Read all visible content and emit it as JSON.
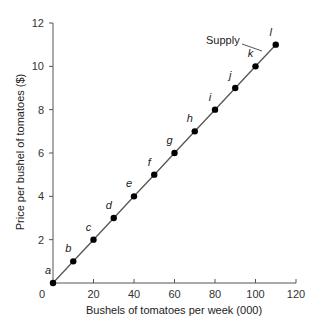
{
  "chart_data": {
    "type": "line",
    "title": "",
    "xlabel": "Bushels of tomatoes per week (000)",
    "ylabel": "Price per bushel of tomatoes ($)",
    "xlim": [
      0,
      120
    ],
    "ylim": [
      0,
      12
    ],
    "xticks": [
      0,
      20,
      40,
      60,
      80,
      100,
      120
    ],
    "yticks": [
      2,
      4,
      6,
      8,
      10,
      12
    ],
    "grid": false,
    "series": [
      {
        "name": "Supply",
        "points": [
          {
            "label": "a",
            "x": 0,
            "y": 0
          },
          {
            "label": "b",
            "x": 10,
            "y": 1
          },
          {
            "label": "c",
            "x": 20,
            "y": 2
          },
          {
            "label": "d",
            "x": 30,
            "y": 3
          },
          {
            "label": "e",
            "x": 40,
            "y": 4
          },
          {
            "label": "f",
            "x": 50,
            "y": 5
          },
          {
            "label": "g",
            "x": 60,
            "y": 6
          },
          {
            "label": "h",
            "x": 70,
            "y": 7
          },
          {
            "label": "i",
            "x": 80,
            "y": 8
          },
          {
            "label": "j",
            "x": 90,
            "y": 9
          },
          {
            "label": "k",
            "x": 100,
            "y": 10
          },
          {
            "label": "l",
            "x": 110,
            "y": 11
          }
        ]
      }
    ],
    "annotations": [
      {
        "text": "Supply",
        "target_series": "Supply"
      }
    ]
  }
}
